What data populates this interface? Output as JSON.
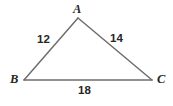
{
  "figure": {
    "kind": "triangle-diagram",
    "background_color": "#ffffff",
    "stroke_color": "#6e6e6e",
    "label_color": "#262626",
    "vertices": {
      "a": {
        "label": "A",
        "x": 78,
        "y": 18
      },
      "b": {
        "label": "B",
        "x": 24,
        "y": 80
      },
      "c": {
        "label": "C",
        "x": 152,
        "y": 80
      }
    },
    "sides": {
      "ab": {
        "label": "12",
        "from": "B",
        "to": "A"
      },
      "ac": {
        "label": "14",
        "from": "A",
        "to": "C"
      },
      "bc": {
        "label": "18",
        "from": "B",
        "to": "C"
      }
    }
  },
  "chart_data": {
    "type": "diagram",
    "title": "",
    "categories": [
      "AB",
      "AC",
      "BC"
    ],
    "values": [
      12,
      14,
      18
    ],
    "point_labels": [
      "A",
      "B",
      "C"
    ],
    "points": [
      {
        "name": "A",
        "x": 78,
        "y": 18
      },
      {
        "name": "B",
        "x": 24,
        "y": 80
      },
      {
        "name": "C",
        "x": 152,
        "y": 80
      }
    ],
    "edges": [
      {
        "name": "AB",
        "from": "B",
        "to": "A",
        "length_label": "12"
      },
      {
        "name": "AC",
        "from": "A",
        "to": "C",
        "length_label": "14"
      },
      {
        "name": "BC",
        "from": "B",
        "to": "C",
        "length_label": "18"
      }
    ],
    "xlabel": "",
    "ylabel": "",
    "grid": false,
    "legend": "none"
  }
}
